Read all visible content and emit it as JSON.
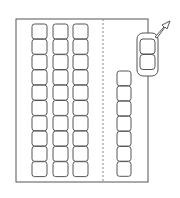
{
  "diagram": {
    "colors": {
      "stroke": "#555555",
      "background": "#ffffff",
      "dashed": "#888888"
    },
    "lot": {
      "x": 16,
      "y": 19,
      "width": 132,
      "height": 163
    },
    "divider": {
      "x": 103,
      "y1": 19,
      "y2": 182,
      "style": "dashed"
    },
    "columns": [
      {
        "name": "column-1",
        "x": 32,
        "y": 24,
        "width": 15,
        "cell_height": 15.3,
        "cells": 10
      },
      {
        "name": "column-2",
        "x": 53,
        "y": 24,
        "width": 15,
        "cell_height": 15.3,
        "cells": 10
      },
      {
        "name": "column-3",
        "x": 73,
        "y": 24,
        "width": 15,
        "cell_height": 15.3,
        "cells": 10
      },
      {
        "name": "column-4",
        "x": 117,
        "y": 71,
        "width": 14,
        "cell_height": 15.1,
        "cells": 7
      }
    ],
    "exiting_car": {
      "x": 137,
      "y": 33,
      "width": 21,
      "height": 43,
      "cells": 2
    },
    "exit_arrow": {
      "direction": "up-right"
    }
  }
}
